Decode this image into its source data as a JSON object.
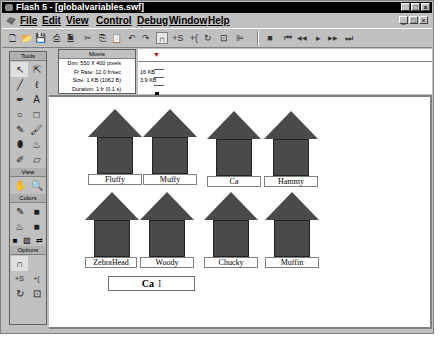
{
  "window": {
    "title": "Flash 5 - [globalvariables.swf]",
    "controls": [
      "_",
      "□",
      "×"
    ]
  },
  "menubar": {
    "items": [
      "File",
      "Edit",
      "View",
      "Control",
      "Debug",
      "Window",
      "Help"
    ]
  },
  "toolbar": {
    "buttons": [
      "new-icon",
      "open-icon",
      "save-icon",
      "print-icon",
      "print-preview-icon",
      "cut-icon",
      "copy-icon",
      "paste-icon",
      "undo-icon",
      "redo-icon",
      "snap-magnet-icon",
      "smooth-icon",
      "straighten-icon",
      "rotate-icon",
      "scale-icon",
      "align-icon"
    ],
    "playback": [
      "stop",
      "rewind",
      "step-back",
      "play",
      "step-forward",
      "go-to-end"
    ],
    "glyphs": {
      "new": "🗋",
      "open": "📂",
      "save": "💾",
      "print": "⎙",
      "preview": "🗎",
      "cut": "✂",
      "copy": "⎘",
      "paste": "📋",
      "undo": "↶",
      "redo": "↷",
      "magnet": "∩",
      "smooth": "+S",
      "straighten": "+(",
      "rotate": "↻",
      "scale": "⊡",
      "align": "⊫",
      "stop": "■",
      "rewind": "⏮",
      "back": "◀◀",
      "play": "▸",
      "fwd": "▶▶",
      "end": "⏭"
    }
  },
  "tools_panel": {
    "header": "Tools",
    "tools": [
      "↖",
      "⇱",
      "╱",
      "ℓ",
      "✒",
      "A",
      "○",
      "□",
      "✎",
      "🖌",
      "⬮",
      "♨",
      "✐",
      "▱"
    ],
    "view_header": "View",
    "view_tools": [
      "✋",
      "🔍"
    ],
    "colors_header": "Colors",
    "color_tools": [
      "✎",
      "■",
      "♨",
      "■"
    ],
    "color_swatches": [
      "■",
      "▨",
      "⇄"
    ],
    "options_header": "Options",
    "options": [
      "∩",
      "",
      "+S",
      "+(",
      "↻",
      "⊡"
    ]
  },
  "movie_panel": {
    "header": "Movie",
    "dims": "Dim: 550 X 400 pixels",
    "frame_rate": "Fr Rate: 12.0 fr/sec",
    "size": "Size: 1 KB (1062 B)",
    "duration": "Duration: 1 fr (0.1 s)"
  },
  "bandwidth": {
    "label_16kb": "16 KB",
    "label_3_9kb": "3.9 KB"
  },
  "houses": [
    {
      "name": "Fluffy"
    },
    {
      "name": "Muffy"
    },
    {
      "name": "Ca"
    },
    {
      "name": "Hammy"
    },
    {
      "name": "ZebraHead"
    },
    {
      "name": "Woody"
    },
    {
      "name": "Chucky"
    },
    {
      "name": "Muffin"
    }
  ],
  "input_field": {
    "value": "Ca",
    "cursor": "I"
  },
  "colors": {
    "house_fill": "#4a4a4a",
    "chrome": "#c0c0c0",
    "titlebar": "#000000"
  }
}
